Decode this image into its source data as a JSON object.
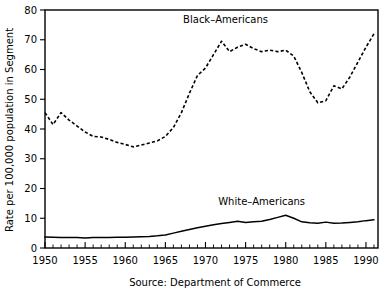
{
  "chart_data": {
    "type": "line",
    "title": "",
    "xlabel": "",
    "ylabel": "Rate per 100,000 population in Segment",
    "caption": "Source: Department of Commerce",
    "xlim": [
      1950,
      1991.5
    ],
    "ylim": [
      0,
      80
    ],
    "grid": false,
    "legend_position": "inline-annotations",
    "x_major_ticks": [
      1950,
      1955,
      1960,
      1965,
      1970,
      1975,
      1980,
      1985,
      1990
    ],
    "x_tick_labels": [
      "1950",
      "1955",
      "1960",
      "1965",
      "1970",
      "1975",
      "1980",
      "1985",
      "1990"
    ],
    "x_minor_tick_step": 1,
    "y_major_ticks": [
      0,
      10,
      20,
      30,
      40,
      50,
      60,
      70,
      80
    ],
    "y_tick_labels": [
      "0",
      "10",
      "20",
      "30",
      "40",
      "50",
      "60",
      "70",
      "80"
    ],
    "x": [
      1950,
      1951,
      1952,
      1953,
      1954,
      1955,
      1956,
      1957,
      1958,
      1959,
      1960,
      1961,
      1962,
      1963,
      1964,
      1965,
      1966,
      1967,
      1968,
      1969,
      1970,
      1971,
      1972,
      1973,
      1974,
      1975,
      1976,
      1977,
      1978,
      1979,
      1980,
      1981,
      1982,
      1983,
      1984,
      1985,
      1986,
      1987,
      1988,
      1989,
      1990,
      1991
    ],
    "series": [
      {
        "name": "Black-Americans",
        "style": "dashed",
        "color": "#000000",
        "label_x": 1972.5,
        "label_y": 75.5,
        "values": [
          45.5,
          41.5,
          45.5,
          43.0,
          41.0,
          39.0,
          37.5,
          37.3,
          36.5,
          35.5,
          34.8,
          34.0,
          34.6,
          35.3,
          36.0,
          37.5,
          40.5,
          45.5,
          52.0,
          58.0,
          60.5,
          65.0,
          69.5,
          66.0,
          67.5,
          68.5,
          67.0,
          66.0,
          66.5,
          66.0,
          66.5,
          64.5,
          59.0,
          52.5,
          48.8,
          49.5,
          54.5,
          53.5,
          57.5,
          62.5,
          67.5,
          72.0
        ]
      },
      {
        "name": "White-Americans",
        "style": "solid",
        "color": "#000000",
        "label_x": 1977.0,
        "label_y": 14.5,
        "values": [
          3.7,
          3.6,
          3.5,
          3.5,
          3.5,
          3.4,
          3.5,
          3.5,
          3.5,
          3.6,
          3.6,
          3.7,
          3.8,
          3.9,
          4.1,
          4.4,
          5.0,
          5.6,
          6.2,
          6.8,
          7.3,
          7.8,
          8.2,
          8.6,
          9.0,
          8.6,
          8.8,
          9.0,
          9.6,
          10.3,
          11.0,
          10.0,
          8.8,
          8.5,
          8.3,
          8.7,
          8.3,
          8.4,
          8.6,
          8.8,
          9.2,
          9.5
        ]
      }
    ]
  },
  "labels": {
    "ylabel": "Rate per 100,000 population in Segment",
    "caption": "Source: Department of Commerce",
    "series_black": "Black–Americans",
    "series_white": "White–Americans"
  }
}
